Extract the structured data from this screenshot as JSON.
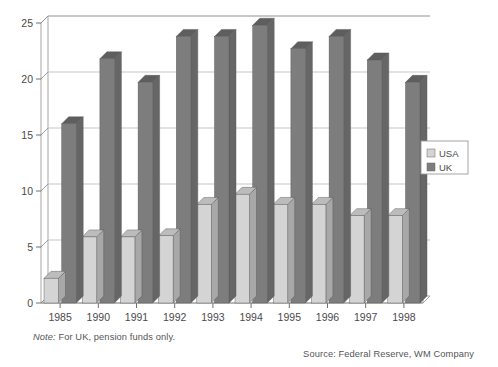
{
  "chart_data": {
    "type": "bar",
    "title": "",
    "subtitle": "",
    "xlabel": "",
    "ylabel": "",
    "categories": [
      "1985",
      "1990",
      "1991",
      "1992",
      "1993",
      "1994",
      "1995",
      "1996",
      "1997",
      "1998"
    ],
    "series": [
      {
        "name": "USA",
        "color": "#d4d4d4",
        "values": [
          2.2,
          5.9,
          5.9,
          6.0,
          8.8,
          9.7,
          8.8,
          8.8,
          7.8,
          7.8
        ]
      },
      {
        "name": "UK",
        "color": "#7d7d7d",
        "values": [
          16.0,
          21.8,
          19.7,
          23.8,
          23.8,
          24.8,
          22.7,
          23.8,
          21.7,
          19.7
        ]
      }
    ],
    "ylim": [
      0,
      25
    ],
    "yticks": [
      0,
      5,
      10,
      15,
      20,
      25
    ],
    "ytick_labels": [
      "0",
      "5",
      "10",
      "15",
      "20",
      "25"
    ],
    "grid": true,
    "grid_axis": "y",
    "legend_position": "right",
    "style": "3d-bars"
  },
  "legend": {
    "entries": [
      {
        "label": "USA",
        "swatch": "#d4d4d4"
      },
      {
        "label": "UK",
        "swatch": "#7d7d7d"
      }
    ]
  },
  "footnotes": {
    "note_lead": "Note:",
    "note_body": " For UK, pension funds only.",
    "source": "Source: Federal Reserve, WM Company"
  },
  "colors": {
    "usa_face": "#d4d4d4",
    "usa_top": "#bcbcbc",
    "usa_side": "#a8a8a8",
    "uk_face": "#7d7d7d",
    "uk_top": "#5e5e5e",
    "uk_side": "#666666",
    "grid": "#b9b9b9",
    "axis": "#6e6e6e",
    "text": "#4a4a4a"
  }
}
